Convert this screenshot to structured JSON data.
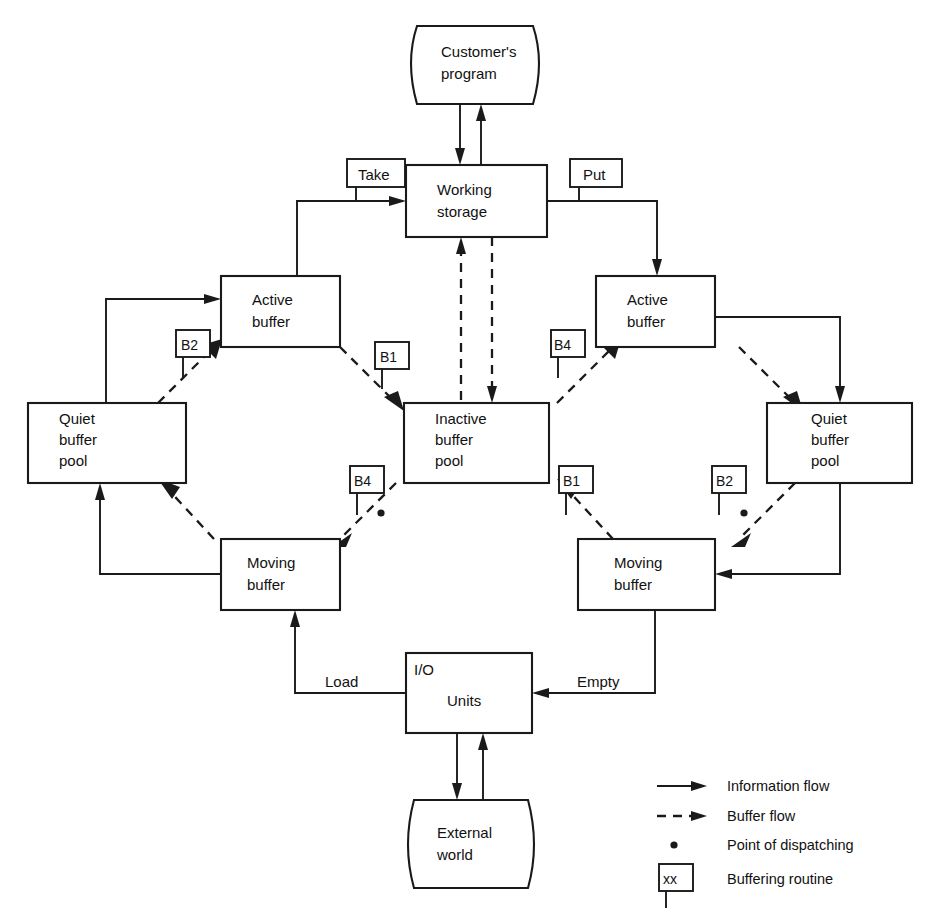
{
  "diagram": {
    "nodes": {
      "customer_program": "Customer's\nprogram",
      "customer_program_l1": "Customer's",
      "customer_program_l2": "program",
      "working_storage_l1": "Working",
      "working_storage_l2": "storage",
      "take": "Take",
      "put": "Put",
      "active_buffer_left_l1": "Active",
      "active_buffer_left_l2": "buffer",
      "active_buffer_right_l1": "Active",
      "active_buffer_right_l2": "buffer",
      "quiet_pool_left_l1": "Quiet",
      "quiet_pool_left_l2": "buffer",
      "quiet_pool_left_l3": "pool",
      "quiet_pool_right_l1": "Quiet",
      "quiet_pool_right_l2": "buffer",
      "quiet_pool_right_l3": "pool",
      "inactive_pool_l1": "Inactive",
      "inactive_pool_l2": "buffer",
      "inactive_pool_l3": "pool",
      "moving_buffer_left_l1": "Moving",
      "moving_buffer_left_l2": "buffer",
      "moving_buffer_right_l1": "Moving",
      "moving_buffer_right_l2": "buffer",
      "io_units_l1": "I/O",
      "io_units_l2": "Units",
      "external_world_l1": "External",
      "external_world_l2": "world",
      "load": "Load",
      "empty": "Empty"
    },
    "routine_tags": {
      "left_top": "B2",
      "left_right_top": "B1",
      "left_bottom": "B4",
      "center_right_bottom": "B1",
      "right_top": "B4",
      "right_bottom": "B2"
    },
    "legend": {
      "information_flow": "Information flow",
      "buffer_flow": "Buffer flow",
      "point_of_dispatching": "Point of dispatching",
      "buffering_routine": "Buffering routine",
      "routine_sample": "xx"
    },
    "colors": {
      "ink": "#1a1a1a",
      "paper": "#ffffff"
    }
  }
}
